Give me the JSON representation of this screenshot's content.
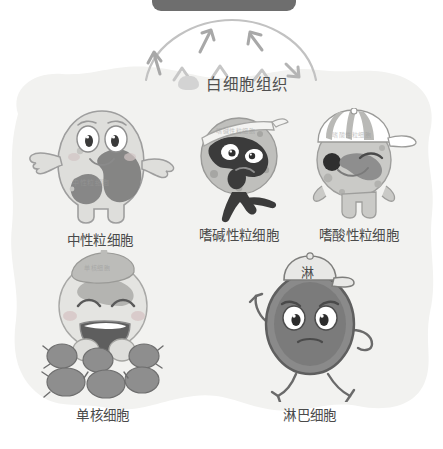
{
  "page": {
    "title_icon": "blob-icon",
    "title": "白细胞组织",
    "background_color": "#ffffff",
    "panel_color": "#f2f2f0",
    "label_color": "#4a4a4a",
    "topbar_color": "#6e6e6e"
  },
  "topbar": {
    "name": "dark-rounded-bar",
    "label": ""
  },
  "diagram": {
    "arc": {
      "name": "radiating-arc",
      "arrow_count": 3,
      "chevron_count": 3,
      "stroke_color": "#b8b8b8"
    },
    "cells": [
      {
        "id": "neutrophil",
        "label": "中性粒细胞",
        "body_watermark": "中性粒细胞",
        "accent": "#8f8f8f",
        "body_fill": "#dcdcda",
        "granule_fill": "#7e7e7e",
        "accessory": "none",
        "row": 1
      },
      {
        "id": "basophil",
        "label": "嗜碱性粒细胞",
        "body_watermark": "嗜碱性粒细胞",
        "accent": "#5e5e5e",
        "body_fill": "#bdbdbb",
        "granule_fill": "#3a3a3a",
        "accessory": "headband",
        "row": 1
      },
      {
        "id": "eosinophil",
        "label": "嗜酸性粒细胞",
        "body_watermark": "嗜酸性粒细胞",
        "accent": "#8a8a8a",
        "body_fill": "#c9c9c6",
        "granule_fill": "#6f6f6f",
        "accessory": "striped-cap",
        "row": 1
      },
      {
        "id": "monocyte",
        "label": "单核细胞",
        "body_watermark": "单核细胞",
        "accent": "#9a9a9a",
        "body_fill": "#e2e2df",
        "granule_fill": "#8e8e8e",
        "accessory": "beret",
        "row": 2
      },
      {
        "id": "lymphocyte",
        "label": "淋巴细胞",
        "cap_text": "淋",
        "accent": "#6e6e6e",
        "body_fill": "#7d7d7d",
        "granule_fill": "#5a5a5a",
        "accessory": "cap",
        "row": 2
      }
    ]
  }
}
